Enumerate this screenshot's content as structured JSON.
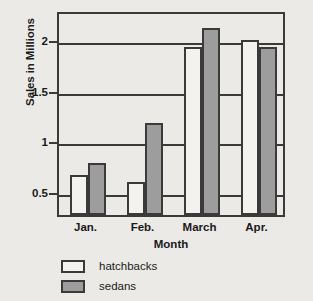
{
  "chart_data": {
    "type": "bar",
    "title": "",
    "xlabel": "Month",
    "ylabel": "Sales in Millions",
    "categories": [
      "Jan.",
      "Feb.",
      "March",
      "Apr."
    ],
    "series": [
      {
        "name": "hatchbacks",
        "color": "#ffffff",
        "values": [
          0.67,
          0.6,
          1.93,
          2.0
        ]
      },
      {
        "name": "sedans",
        "color": "#9d9d9d",
        "values": [
          0.79,
          1.18,
          2.12,
          1.93
        ]
      }
    ],
    "yticks": [
      0.5,
      1,
      1.5,
      2
    ],
    "ytick_labels": [
      "0.5",
      "1",
      "1.5",
      "2"
    ],
    "ylim": [
      0.27,
      2.3
    ],
    "grid": true,
    "legend_position": "below-left",
    "legend": [
      "hatchbacks",
      "sedans"
    ],
    "axis_color": "#3a3a3a",
    "background_color": "#eceae6"
  }
}
